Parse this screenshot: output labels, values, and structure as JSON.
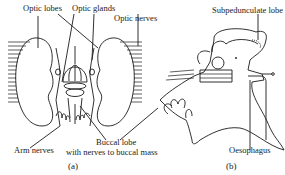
{
  "figure": {
    "panel_a": {
      "caption": "(a)",
      "labels": {
        "optic_lobes": "Optic lobes",
        "optic_glands": "Optic glands",
        "optic_nerves": "Optic nerves",
        "arm_nerves": "Arm nerves",
        "buccal_lobe_line1": "Buccal lobe",
        "buccal_lobe_line2": "with nerves to buccal mass"
      }
    },
    "panel_b": {
      "caption": "(b)",
      "labels": {
        "subpedunculate_lobe": "Subpedunculate lobe",
        "oesophagus": "Oesophagus"
      }
    },
    "colors": {
      "ink": "#1a1a1a",
      "background": "#ffffff"
    }
  }
}
